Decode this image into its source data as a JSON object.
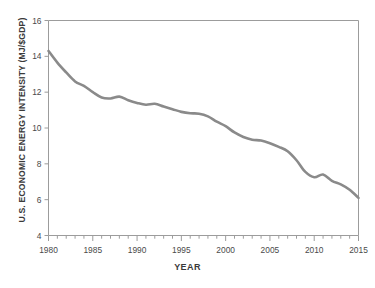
{
  "chart_data": {
    "type": "line",
    "title": "",
    "subtitle": "",
    "xlabel": "YEAR",
    "ylabel": "U.S. ECONOMIC ENERGY INTENSITY (MJ/$GDP)",
    "xlim": [
      1980,
      2015
    ],
    "ylim": [
      4,
      16
    ],
    "grid": false,
    "legend": null,
    "legend_position": "none",
    "line_color": "#8a8a8a",
    "line_width": 2.6,
    "x_major_ticks": [
      1980,
      1985,
      1990,
      1995,
      2000,
      2005,
      2010,
      2015
    ],
    "x_tick_labels": [
      "1980",
      "1985",
      "1990",
      "1995",
      "2000",
      "2005",
      "2010",
      "2015"
    ],
    "x_minor_tick_step": 1,
    "y_major_ticks": [
      4,
      6,
      8,
      10,
      12,
      14,
      16
    ],
    "y_tick_labels": [
      "4",
      "6",
      "8",
      "10",
      "12",
      "14",
      "16"
    ],
    "x": [
      1980,
      1981,
      1982,
      1983,
      1984,
      1985,
      1986,
      1987,
      1988,
      1989,
      1990,
      1991,
      1992,
      1993,
      1994,
      1995,
      1996,
      1997,
      1998,
      1999,
      2000,
      2001,
      2002,
      2003,
      2004,
      2005,
      2006,
      2007,
      2008,
      2009,
      2010,
      2011,
      2012,
      2013,
      2014,
      2015
    ],
    "values": [
      14.3,
      13.65,
      13.1,
      12.6,
      12.35,
      12.0,
      11.7,
      11.65,
      11.75,
      11.55,
      11.4,
      11.3,
      11.35,
      11.2,
      11.05,
      10.9,
      10.82,
      10.8,
      10.65,
      10.35,
      10.1,
      9.75,
      9.5,
      9.35,
      9.3,
      9.15,
      8.95,
      8.7,
      8.2,
      7.55,
      7.25,
      7.4,
      7.05,
      6.85,
      6.55,
      6.1
    ],
    "series": [
      {
        "name": "U.S. Economic Energy Intensity",
        "color": "#8a8a8a",
        "values": [
          14.3,
          13.65,
          13.1,
          12.6,
          12.35,
          12.0,
          11.7,
          11.65,
          11.75,
          11.55,
          11.4,
          11.3,
          11.35,
          11.2,
          11.05,
          10.9,
          10.82,
          10.8,
          10.65,
          10.35,
          10.1,
          9.75,
          9.5,
          9.35,
          9.3,
          9.15,
          8.95,
          8.7,
          8.2,
          7.55,
          7.25,
          7.4,
          7.05,
          6.85,
          6.55,
          6.1
        ]
      }
    ],
    "annotations": []
  },
  "axes": {
    "spine_color": "#9c9c9c",
    "tick_color": "#9c9c9c",
    "text_color": "#4a4a4a"
  },
  "footer": {
    "fragment_left": "",
    "fragment_mid": "",
    "fragment_right": ""
  }
}
